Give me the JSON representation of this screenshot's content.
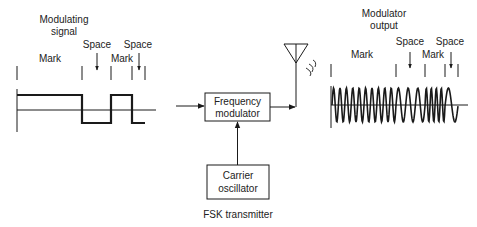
{
  "title": "FSK transmitter",
  "input_signal": {
    "title_line1": "Modulating",
    "title_line2": "signal",
    "labels": {
      "mark1": "Mark",
      "space1": "Space",
      "mark2": "Mark",
      "space2": "Space"
    }
  },
  "blocks": {
    "modulator_line1": "Frequency",
    "modulator_line2": "modulator",
    "oscillator_line1": "Carrier",
    "oscillator_line2": "oscillator"
  },
  "output_signal": {
    "title_line1": "Modulator",
    "title_line2": "output",
    "labels": {
      "mark1": "Mark",
      "space1": "Space",
      "mark2": "Mark",
      "space2": "Space"
    }
  },
  "colors": {
    "line": "#1a1a1a",
    "background": "#ffffff"
  }
}
